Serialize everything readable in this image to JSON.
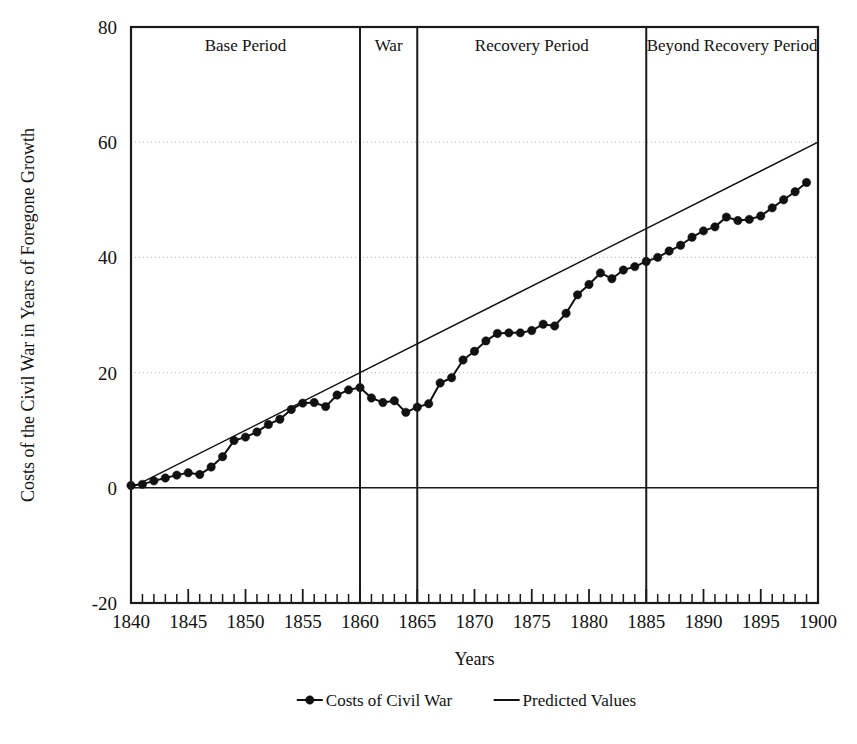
{
  "chart_data": {
    "type": "line",
    "title": "",
    "xlabel": "Years",
    "ylabel": "Costs of the Civil War in Years of Foregone Growth",
    "xlim": [
      1840,
      1900
    ],
    "ylim": [
      -20,
      80
    ],
    "y_ticks": [
      80,
      60,
      40,
      20,
      0,
      -20
    ],
    "x_ticks": [
      1840,
      1845,
      1850,
      1855,
      1860,
      1865,
      1870,
      1875,
      1880,
      1885,
      1890,
      1895,
      1900
    ],
    "x_minor_step": 1,
    "grid": "horizontal-dotted",
    "legend_position": "bottom",
    "legend": [
      "Costs of Civil War",
      "Predicted Values"
    ],
    "annotations": [
      {
        "label": "Base Period",
        "start": 1840,
        "end": 1860
      },
      {
        "label": "War",
        "start": 1860,
        "end": 1865
      },
      {
        "label": "Recovery Period",
        "start": 1865,
        "end": 1885
      },
      {
        "label": "Beyond Recovery Period",
        "start": 1885,
        "end": 1900
      }
    ],
    "x": [
      1840,
      1841,
      1842,
      1843,
      1844,
      1845,
      1846,
      1847,
      1848,
      1849,
      1850,
      1851,
      1852,
      1853,
      1854,
      1855,
      1856,
      1857,
      1858,
      1859,
      1860,
      1861,
      1862,
      1863,
      1864,
      1865,
      1866,
      1867,
      1868,
      1869,
      1870,
      1871,
      1872,
      1873,
      1874,
      1875,
      1876,
      1877,
      1878,
      1879,
      1880,
      1881,
      1882,
      1883,
      1884,
      1885,
      1886,
      1887,
      1888,
      1889,
      1890,
      1891,
      1892,
      1893,
      1894,
      1895,
      1896,
      1897,
      1898,
      1899
    ],
    "series": [
      {
        "name": "Costs of Civil War",
        "marker": "filled-circle",
        "values": [
          0.4,
          0.6,
          1.2,
          1.7,
          2.2,
          2.6,
          2.3,
          3.6,
          5.4,
          8.2,
          8.8,
          9.7,
          11.0,
          11.9,
          13.6,
          14.7,
          14.8,
          14.1,
          16.1,
          17.0,
          17.4,
          15.6,
          14.8,
          15.1,
          13.1,
          14.0,
          14.6,
          18.2,
          19.1,
          22.2,
          23.7,
          25.5,
          26.8,
          26.9,
          26.9,
          27.3,
          28.4,
          28.1,
          30.3,
          33.5,
          35.3,
          37.3,
          36.3,
          37.8,
          38.4,
          39.3,
          40.0,
          41.1,
          42.1,
          43.5,
          44.6,
          45.3,
          47.0,
          46.4,
          46.6,
          47.2,
          48.6,
          50.0,
          51.4,
          53.0
        ]
      },
      {
        "name": "Predicted Values",
        "marker": "none",
        "values": [
          0.0,
          1.0,
          2.0,
          3.0,
          4.0,
          5.0,
          6.0,
          7.0,
          8.0,
          9.0,
          10.0,
          11.0,
          12.0,
          13.0,
          14.0,
          15.0,
          16.0,
          17.0,
          18.0,
          19.0,
          20.0,
          21.0,
          22.0,
          23.0,
          24.0,
          25.0,
          26.0,
          27.0,
          28.0,
          29.0,
          30.0,
          31.0,
          32.0,
          33.0,
          34.0,
          35.0,
          36.0,
          37.0,
          38.0,
          39.0,
          40.0,
          41.0,
          42.0,
          43.0,
          44.0,
          45.0,
          46.0,
          47.0,
          48.0,
          49.0,
          50.0,
          51.0,
          52.0,
          53.0,
          54.0,
          55.0,
          56.0,
          57.0,
          58.0,
          59.0
        ]
      }
    ]
  }
}
